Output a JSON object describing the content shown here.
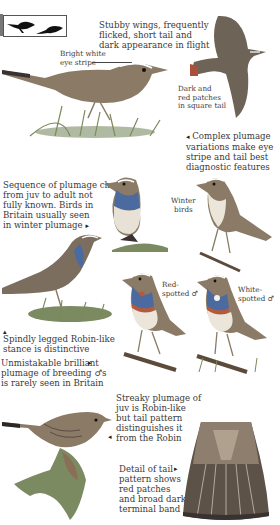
{
  "species_icons": {
    "label": "size-silhouettes",
    "count": 2
  },
  "captions": {
    "flight": "Stubby wings, frequently\nflicked, short tail and\ndark appearance in flight",
    "eye_stripe": "Bright white\neye stripe",
    "tail_patches": "Dark and\nred patches\nin square tail",
    "complex": "Complex plumage\nvariations make eye\nstripe and tail best\ndiagnostic features",
    "sequence": "Sequence of plumage change\nfrom juv to adult not\nfully known. Birds in\nBritain usually seen\nin winter plumage",
    "winter": "Winter\nbirds",
    "red_spotted": "Red-\nspotted ♂",
    "white_spotted": "White-\nspotted ♂",
    "stance": "Spindly legged Robin-like\nstance is distinctive",
    "breeding": "Unmistakable brilliant\nplumage of breeding ♂s\nis rarely seen in Britain",
    "juv": "Streaky plumage of\njuv is Robin-like\nbut tail pattern\ndistinguishes it\nfrom the Robin",
    "tail_detail": "Detail of tail\npattern shows\nred patches\nand broad dark\nterminal band"
  },
  "arrows": {
    "left": "◂",
    "right": "▸",
    "up": "▴"
  },
  "colors": {
    "text": "#3a3a3a",
    "bird_brown": "#8a7a66",
    "bird_dark": "#4a4038",
    "blue_throat": "#4a6aa0",
    "red_band": "#b8573a",
    "grass": "#7a8a5a"
  }
}
